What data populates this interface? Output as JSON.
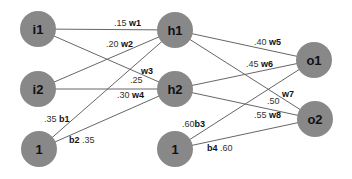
{
  "diagram": {
    "title": "",
    "node_color": "#888888",
    "nodes": [
      {
        "id": "i1",
        "label": "i1",
        "x": 38,
        "y": 29
      },
      {
        "id": "i2",
        "label": "i2",
        "x": 38,
        "y": 89
      },
      {
        "id": "b1n",
        "label": "1",
        "x": 39,
        "y": 149
      },
      {
        "id": "h1",
        "label": "h1",
        "x": 175,
        "y": 30
      },
      {
        "id": "h2",
        "label": "h2",
        "x": 175,
        "y": 89
      },
      {
        "id": "b2n",
        "label": "1",
        "x": 175,
        "y": 149
      },
      {
        "id": "o1",
        "label": "o1",
        "x": 314,
        "y": 60
      },
      {
        "id": "o2",
        "label": "o2",
        "x": 315,
        "y": 119
      }
    ],
    "edges": [
      {
        "from": "i1",
        "to": "h1",
        "weight_name": "w1",
        "value": ".15"
      },
      {
        "from": "i2",
        "to": "h1",
        "weight_name": "w2",
        "value": ".20"
      },
      {
        "from": "i1",
        "to": "h2",
        "weight_name": "w3",
        "value": ".25"
      },
      {
        "from": "i2",
        "to": "h2",
        "weight_name": "w4",
        "value": ".30"
      },
      {
        "from": "b1n",
        "to": "h1",
        "weight_name": "b1",
        "value": ".35"
      },
      {
        "from": "b1n",
        "to": "h2",
        "weight_name": "b2",
        "value": ".35"
      },
      {
        "from": "h1",
        "to": "o1",
        "weight_name": "w5",
        "value": ".40"
      },
      {
        "from": "h2",
        "to": "o1",
        "weight_name": "w6",
        "value": ".45"
      },
      {
        "from": "h1",
        "to": "o2",
        "weight_name": "w7",
        "value": ".50"
      },
      {
        "from": "h2",
        "to": "o2",
        "weight_name": "w8",
        "value": ".55"
      },
      {
        "from": "b2n",
        "to": "o1",
        "weight_name": "b3",
        "value": ".60"
      },
      {
        "from": "b2n",
        "to": "o2",
        "weight_name": "b4",
        "value": ".60"
      }
    ]
  }
}
